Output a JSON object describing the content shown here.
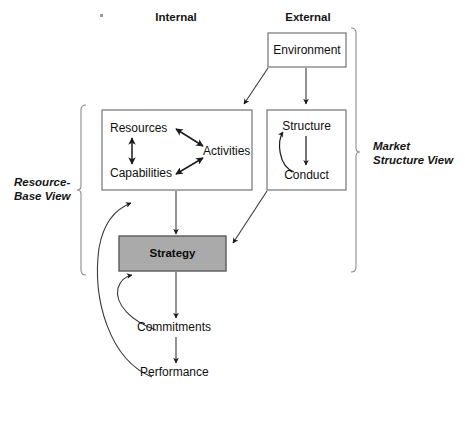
{
  "diagram": {
    "columns": {
      "internal_label": "Internal",
      "external_label": "External"
    },
    "side_labels": {
      "left": "Resource-\nBase View",
      "left_line1": "Resource-",
      "left_line2": "Base View",
      "right_line1": "Market",
      "right_line2": "Structure View"
    },
    "boxes": {
      "environment": "Environment",
      "internal_group": {
        "resources": "Resources",
        "capabilities": "Capabilities",
        "activities": "Activities"
      },
      "external_group": {
        "structure": "Structure",
        "conduct": "Conduct"
      },
      "strategy": "Strategy"
    },
    "nodes": {
      "commitments": "Commitments",
      "performance": "Performance"
    },
    "colors": {
      "strategy_fill": "#aaaaaa",
      "stroke": "#555555",
      "text": "#101010",
      "background": "#ffffff"
    }
  }
}
